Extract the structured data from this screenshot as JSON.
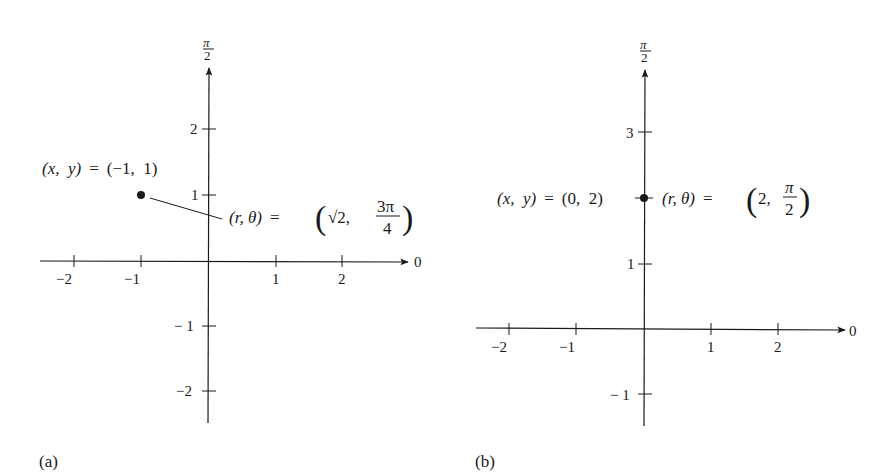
{
  "figures": [
    {
      "id": "a",
      "caption": "(a)",
      "axis_labels": {
        "polar_axis": "0",
        "vertical_axis_num": "π",
        "vertical_axis_den": "2"
      },
      "x_ticks": [
        "−2",
        "−1",
        "1",
        "2"
      ],
      "y_ticks": [
        "2",
        "1",
        "− 1",
        "−2"
      ],
      "point": {
        "x": -1,
        "y": 1
      },
      "rect_label": {
        "lhs": "(x,  y)",
        "eq": "=",
        "rhs": "(−1,  1)"
      },
      "polar_label": {
        "lhs": "(r,  θ)",
        "eq": "=",
        "r": "√2,",
        "theta_num": "3π",
        "theta_den": "4"
      }
    },
    {
      "id": "b",
      "caption": "(b)",
      "axis_labels": {
        "polar_axis": "0",
        "vertical_axis_num": "π",
        "vertical_axis_den": "2"
      },
      "x_ticks": [
        "−2",
        "−1",
        "1",
        "2"
      ],
      "y_ticks": [
        "3",
        "1",
        "− 1"
      ],
      "point": {
        "x": 0,
        "y": 2
      },
      "rect_label": {
        "lhs": "(x,  y)",
        "eq": "=",
        "rhs": "(0,  2)"
      },
      "polar_label": {
        "lhs": "(r,  θ)",
        "eq": "=",
        "r": "2,",
        "theta_num": "π",
        "theta_den": "2"
      }
    }
  ],
  "colors": {
    "ink": "#1a1a1a",
    "background": "#ffffff"
  }
}
